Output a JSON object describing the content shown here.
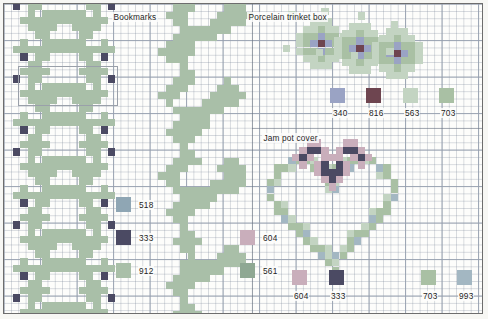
{
  "page": {
    "kind": "cross-stitch-pattern-chart",
    "background": "#fbfbf8",
    "grid_color": "#96a0af",
    "frame_color": "#6d6d6d"
  },
  "titles": {
    "bookmarks": "Bookmarks",
    "trinket_box": "Porcelain trinket box",
    "jam_pot": "Jam pot cover"
  },
  "palette": {
    "518": "#8fa6b4",
    "333": "#4b4a63",
    "912": "#a9bfa8",
    "340": "#9aa3c4",
    "816": "#6e4550",
    "563": "#c3d4c2",
    "703": "#a9c0a4",
    "604": "#c9aebb",
    "561": "#8fa893",
    "993": "#a3b7c2"
  },
  "keys": {
    "bookmarks_left": [
      {
        "code": "518",
        "color": "#8fa6b4"
      },
      {
        "code": "333",
        "color": "#4b4a63"
      },
      {
        "code": "912",
        "color": "#a9bfa8"
      }
    ],
    "trinket_box": [
      {
        "code": "340",
        "color": "#9aa3c4"
      },
      {
        "code": "816",
        "color": "#6e4550"
      },
      {
        "code": "563",
        "color": "#c3d4c2"
      },
      {
        "code": "703",
        "color": "#a9c0a4"
      }
    ],
    "bookmarks_right": [
      {
        "code": "604",
        "color": "#c9aebb"
      },
      {
        "code": "561",
        "color": "#8fa893"
      }
    ],
    "jam_pot": [
      {
        "code": "604",
        "color": "#c9aebb"
      },
      {
        "code": "333",
        "color": "#4b4a63"
      },
      {
        "code": "703",
        "color": "#a9c0a4"
      },
      {
        "code": "993",
        "color": "#a3b7c2"
      }
    ]
  },
  "charts": {
    "bookmark_floral": {
      "name": "bookmark-floral-band",
      "cell": 7.3,
      "note": "repeating diamond floral motif, 4 vertical repeats",
      "motif_rows": [
        "..ooo....ooo..",
        ".ooooo..ooooo.",
        "X.ooo....ooo.X",
        "..o.oooooo.o..",
        ".oooooooooooo.",
        "..oooo..oooo..",
        "...oo....oo...",
        "..o.oooooo.o..",
        ".ooooooooooo..",
        "X..ooo..ooo..X"
      ]
    },
    "bookmark_vine": {
      "name": "bookmark-vine-band",
      "cell": 7.3,
      "note": "climbing stem with alternating leaves"
    },
    "trinket_flowers": {
      "name": "porcelain-trinket-box-motif",
      "cell": 7.3,
      "note": "three blossoms with dark 816 centres on 563/703 foliage"
    },
    "jam_pot_heart": {
      "name": "jam-pot-cover-heart-wreath",
      "cell": 7.3,
      "note": "open heart-shaped wreath outline in 703/993 with 604 and 333 flower cluster at the top"
    }
  }
}
